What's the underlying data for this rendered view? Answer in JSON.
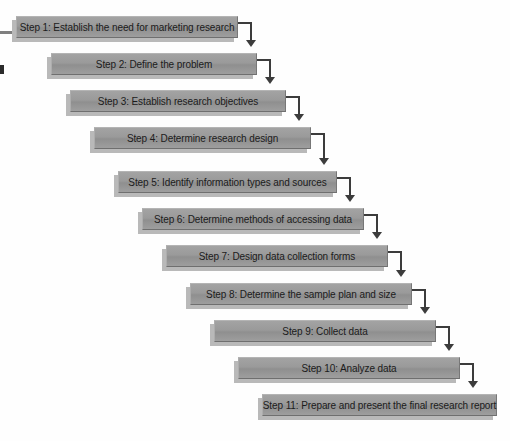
{
  "diagram": {
    "type": "cascading-flowchart",
    "direction": "top-left-to-bottom-right",
    "step_count": 11,
    "colors": {
      "box_fill": "#9a9a9a",
      "box_fill_light": "#a3a3a3",
      "box_border_light": "#b4b4b4",
      "box_border_dark": "#6f6f6f",
      "shadow": "#b9b9b9",
      "connector": "#3c3c3c",
      "text": "#1b1b1b",
      "background": "#fefefe"
    },
    "steps": [
      {
        "number": 1,
        "label": "Step 1: Establish the need for marketing research",
        "left": 16,
        "top": 16,
        "width": 222
      },
      {
        "number": 2,
        "label": "Step 2: Define the problem",
        "left": 51,
        "top": 53,
        "width": 206
      },
      {
        "number": 3,
        "label": "Step 3: Establish research objectives",
        "left": 70,
        "top": 90,
        "width": 216
      },
      {
        "number": 4,
        "label": "Step 4: Determine research design",
        "left": 94,
        "top": 127,
        "width": 217
      },
      {
        "number": 5,
        "label": "Step 5: Identify information types and sources",
        "left": 118,
        "top": 171,
        "width": 219
      },
      {
        "number": 6,
        "label": "Step 6: Determine methods of accessing data",
        "left": 142,
        "top": 208,
        "width": 222
      },
      {
        "number": 7,
        "label": "Step 7: Design data collection forms",
        "left": 166,
        "top": 245,
        "width": 222
      },
      {
        "number": 8,
        "label": "Step 8: Determine the sample plan and size",
        "left": 190,
        "top": 283,
        "width": 222
      },
      {
        "number": 9,
        "label": "Step 9: Collect data",
        "left": 214,
        "top": 320,
        "width": 222
      },
      {
        "number": 10,
        "label": "Step 10: Analyze data",
        "left": 238,
        "top": 357,
        "width": 222
      },
      {
        "number": 11,
        "label": "Step 11: Prepare and present the final research report",
        "left": 262,
        "top": 394,
        "width": 235
      }
    ],
    "connectors": [
      {
        "from": 1,
        "to": 2,
        "x": 238,
        "y": 22,
        "h_len": 14,
        "v_len": 19
      },
      {
        "from": 2,
        "to": 3,
        "x": 257,
        "y": 59,
        "h_len": 14,
        "v_len": 19
      },
      {
        "from": 3,
        "to": 4,
        "x": 286,
        "y": 96,
        "h_len": 14,
        "v_len": 19
      },
      {
        "from": 4,
        "to": 5,
        "x": 311,
        "y": 133,
        "h_len": 14,
        "v_len": 26
      },
      {
        "from": 5,
        "to": 6,
        "x": 337,
        "y": 177,
        "h_len": 14,
        "v_len": 19
      },
      {
        "from": 6,
        "to": 7,
        "x": 364,
        "y": 214,
        "h_len": 14,
        "v_len": 19
      },
      {
        "from": 7,
        "to": 8,
        "x": 388,
        "y": 251,
        "h_len": 14,
        "v_len": 20
      },
      {
        "from": 8,
        "to": 9,
        "x": 412,
        "y": 289,
        "h_len": 14,
        "v_len": 19
      },
      {
        "from": 9,
        "to": 10,
        "x": 436,
        "y": 326,
        "h_len": 14,
        "v_len": 19
      },
      {
        "from": 10,
        "to": 11,
        "x": 460,
        "y": 363,
        "h_len": 14,
        "v_len": 19
      }
    ],
    "artifacts": [
      {
        "name": "margin-dash",
        "left": 0,
        "top": 31,
        "width": 13,
        "height": 3
      },
      {
        "name": "margin-block",
        "left": 0,
        "top": 65,
        "width": 4,
        "height": 9
      }
    ]
  }
}
